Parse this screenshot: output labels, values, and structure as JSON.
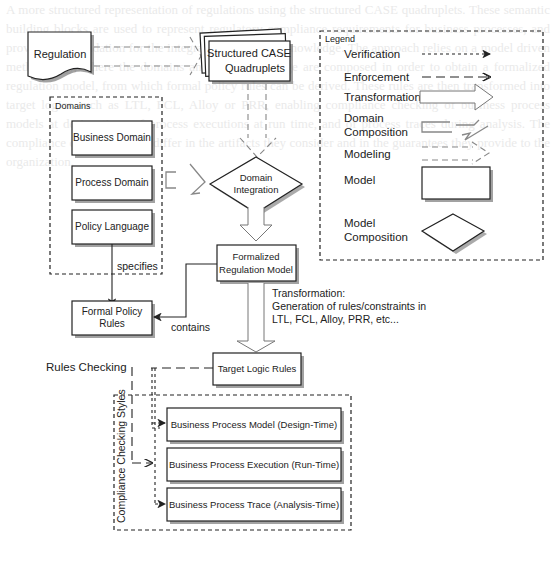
{
  "nodes": {
    "regulation": "Regulation",
    "quadruplets": [
      "Structured CASE",
      "Quadruplets"
    ],
    "domains_title": "Domains",
    "business_domain": "Business Domain",
    "process_domain": "Process Domain",
    "policy_language": "Policy Language",
    "domain_integration": [
      "Domain",
      "Integration"
    ],
    "formalized_model": [
      "Formalized",
      "Regulation Model"
    ],
    "formal_policy_rules": [
      "Formal Policy",
      "Rules"
    ],
    "target_logic_rules": "Target Logic Rules",
    "bp_model": "Business Process Model (Design-Time)",
    "bp_execution": "Business Process Execution (Run-Time)",
    "bp_trace": "Business Process Trace (Analysis-Time)",
    "compliance_title": "Compliance Checking Styles"
  },
  "edge_labels": {
    "specifies": "specifies",
    "contains": "contains",
    "transformation": [
      "Transformation:",
      "Generation of rules/constraints in",
      "LTL, FCL, Alloy, PRR, etc..."
    ],
    "rules_checking": "Rules Checking"
  },
  "legend": {
    "title": "Legend",
    "items": {
      "verification": "Verification",
      "enforcement": "Enforcement",
      "transformation": "Transformation",
      "domain_composition": [
        "Domain",
        "Composition"
      ],
      "modeling": "Modeling",
      "model": "Model",
      "model_composition": [
        "Model",
        "Composition"
      ]
    }
  },
  "background_text": "A more structured representation of regulations using the structured CASE quadruplets. These semantic building blocks are used to represent regulatory compliance requirements for business processes, and provide the foundation for the integration of domain knowledge. The approach relies on a model driven methodology, where the domains and policy language are composed in order to obtain a formalized regulation model, from which formal policy rules can be derived. These rules are then transformed into target logics such as LTL, FCL, Alloy or PRR, enabling compliance checking of business process models at design time, of process executions at run time, and of process traces during analysis. The compliance checking styles differ in the artifacts they consider and in the guarantees they provide to the organization."
}
